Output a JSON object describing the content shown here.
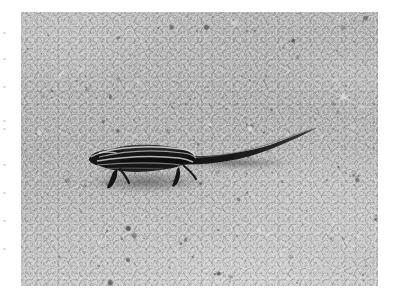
{
  "image": {
    "kind": "photograph",
    "color_mode": "grayscale",
    "orientation": "landscape",
    "subject": "five-lined skink lizard",
    "scene": "lizard resting on sandy gravel ground",
    "canvas": {
      "width": 398,
      "height": 297,
      "background": "#ffffff"
    },
    "photo_area": {
      "left": 21,
      "top": 12,
      "width": 357,
      "height": 274
    }
  },
  "palette": {
    "page_background": "#ffffff",
    "sand_light": "#c6c6c6",
    "sand_mid": "#ababab",
    "sand_dark": "#8e8e8e",
    "pebble_dark": "#4a4a4a",
    "pebble_light": "#e4e4e4",
    "body_black": "#121212",
    "body_shadow": "#2b2b2b",
    "stripe_light": "#d5d5d5",
    "stripe_mid": "#9a9a9a",
    "shadow_ground": "#6f6f6f"
  },
  "subject": {
    "name": "five-lined skink",
    "pose": "facing left, tail curving up to the right",
    "head": {
      "x": 70,
      "y": 146
    },
    "body_length_px": 225,
    "tail_tip": {
      "x": 296,
      "y": 120
    },
    "stripes": 5,
    "legs": [
      {
        "name": "front-leg",
        "x": 96,
        "y": 160
      },
      {
        "name": "hind-leg",
        "x": 157,
        "y": 156
      }
    ]
  },
  "artifacts": {
    "left_margin_marks": [
      {
        "y": 8
      },
      {
        "y": 34
      },
      {
        "y": 62
      },
      {
        "y": 96
      },
      {
        "y": 104
      },
      {
        "y": 140
      },
      {
        "y": 168
      },
      {
        "y": 196
      },
      {
        "y": 224
      }
    ]
  }
}
